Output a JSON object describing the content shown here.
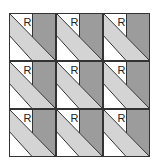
{
  "diagram": {
    "title": "",
    "rows": 3,
    "cols": 3,
    "tile_label": "R",
    "colors": {
      "dark": "#9c9c9c",
      "light": "#d4d4d4",
      "white": "#ffffff",
      "line": "#333333"
    },
    "tiles": [
      {
        "row": 0,
        "col": 0,
        "label": "R"
      },
      {
        "row": 0,
        "col": 1,
        "label": "R"
      },
      {
        "row": 0,
        "col": 2,
        "label": "R"
      },
      {
        "row": 1,
        "col": 0,
        "label": "R"
      },
      {
        "row": 1,
        "col": 1,
        "label": "R"
      },
      {
        "row": 1,
        "col": 2,
        "label": "R"
      },
      {
        "row": 2,
        "col": 0,
        "label": "R"
      },
      {
        "row": 2,
        "col": 1,
        "label": "R"
      },
      {
        "row": 2,
        "col": 2,
        "label": "R"
      }
    ]
  }
}
